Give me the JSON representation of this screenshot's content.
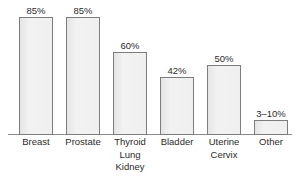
{
  "chart_data": {
    "type": "bar",
    "title": "",
    "subtitle": "",
    "xlabel": "",
    "ylabel": "",
    "ylim": [
      0,
      100
    ],
    "grid": false,
    "legend": "none",
    "categories": [
      "Breast",
      "Prostate",
      "Thyroid Lung Kidney",
      "Bladder",
      "Uterine Cervix",
      "Other"
    ],
    "category_lines": [
      [
        "Breast"
      ],
      [
        "Prostate"
      ],
      [
        "Thyroid",
        "Lung",
        "Kidney"
      ],
      [
        "Bladder"
      ],
      [
        "Uterine",
        "Cervix"
      ],
      [
        "Other"
      ]
    ],
    "values": [
      85,
      85,
      60,
      42,
      50,
      6.5
    ],
    "value_labels": [
      "85%",
      "85%",
      "60%",
      "42%",
      "50%",
      "3–10%"
    ],
    "bar_heights_px": [
      118,
      118,
      83,
      58,
      70,
      15
    ],
    "colors": {
      "bar_fill": "#ededed",
      "bar_border": "#7d7d7d",
      "axis_line": "#8a8a8a",
      "text": "#2b2b2b",
      "background": "#ffffff"
    }
  }
}
